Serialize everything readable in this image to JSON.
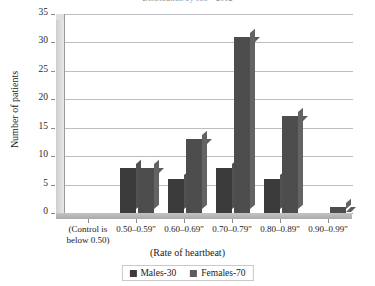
{
  "chart_data": {
    "type": "bar",
    "title": "Distribution by sex – 2012",
    "xlabel": "(Rate of heartbeat)",
    "ylabel": "Number of patients",
    "categories": [
      "(Control is below 0.50)",
      "0.50–0.59″",
      "0.60–0.69″",
      "0.70–0.79″",
      "0.80–0.89″",
      "0.90–0.99″"
    ],
    "series": [
      {
        "name": "Males-30",
        "values": [
          0,
          8,
          6,
          8,
          6,
          0
        ],
        "color": "#3b3b3b"
      },
      {
        "name": "Females-70",
        "values": [
          0,
          8,
          13,
          31,
          17,
          1
        ],
        "color": "#5c5c5c"
      }
    ],
    "ylim": [
      0,
      35
    ],
    "yticks": [
      0,
      5,
      10,
      15,
      20,
      25,
      30,
      35
    ],
    "grid": true,
    "legend_position": "bottom"
  },
  "legend": {
    "items": [
      {
        "label": "Males-30"
      },
      {
        "label": "Females-70"
      }
    ]
  }
}
